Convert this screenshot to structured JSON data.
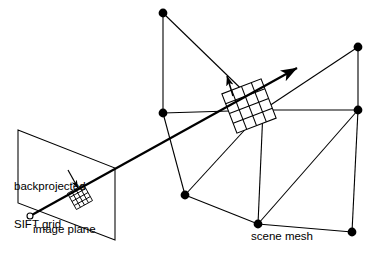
{
  "figure": {
    "background_color": "#ffffff",
    "stroke_color": "#000000",
    "width": 374,
    "height": 255
  },
  "labels": {
    "backprojected_line1": "backprojected",
    "backprojected_line2": "SIFT grid",
    "image_plane": "image plane",
    "scene_mesh": "scene mesh"
  },
  "chart_data": {
    "type": "diagram",
    "title": "",
    "annotations": [
      "backprojected SIFT grid",
      "image plane",
      "scene mesh"
    ],
    "image_plane": {
      "shape": "parallelogram",
      "corners": [
        [
          18,
          130
        ],
        [
          115,
          168
        ],
        [
          115,
          240
        ],
        [
          18,
          203
        ]
      ],
      "stroke": "#000000",
      "fill": "none"
    },
    "camera_center": {
      "x": 30,
      "y": 216,
      "radius": 3,
      "fill": "none"
    },
    "viewing_ray": {
      "from": [
        30,
        216
      ],
      "to": [
        297,
        68
      ],
      "arrowhead": "at_end",
      "width": 2.2
    },
    "sift_grid_2d": {
      "label": "backprojected SIFT grid",
      "center": [
        80,
        197
      ],
      "cells": 4,
      "cell_size": 4.6,
      "rotation_deg": -29
    },
    "sift_grid_3d": {
      "center": [
        249,
        106
      ],
      "cells": 4,
      "cell_size": 10.5,
      "rotation_deg": -21,
      "normal_arrow": {
        "from": [
          233,
          96
        ],
        "to": [
          227,
          76
        ]
      }
    },
    "mesh_nodes": [
      {
        "id": "n1",
        "x": 163,
        "y": 13
      },
      {
        "id": "n2",
        "x": 358,
        "y": 47
      },
      {
        "id": "n3",
        "x": 163,
        "y": 113
      },
      {
        "id": "n4",
        "x": 263,
        "y": 110
      },
      {
        "id": "n5",
        "x": 358,
        "y": 110
      },
      {
        "id": "n6",
        "x": 185,
        "y": 195
      },
      {
        "id": "n7",
        "x": 258,
        "y": 224
      },
      {
        "id": "n8",
        "x": 352,
        "y": 232
      }
    ],
    "mesh_edges": [
      [
        "n1",
        "n3"
      ],
      [
        "n1",
        "n4"
      ],
      [
        "n2",
        "n4"
      ],
      [
        "n2",
        "n5"
      ],
      [
        "n3",
        "n4"
      ],
      [
        "n3",
        "n6"
      ],
      [
        "n4",
        "n5"
      ],
      [
        "n4",
        "n6"
      ],
      [
        "n4",
        "n7"
      ],
      [
        "n5",
        "n7"
      ],
      [
        "n5",
        "n8"
      ],
      [
        "n6",
        "n7"
      ],
      [
        "n7",
        "n8"
      ]
    ],
    "node_radius": 4.4,
    "edge_width": 1.1
  }
}
